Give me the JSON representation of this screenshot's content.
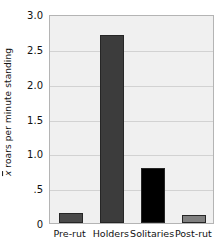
{
  "chart_data": {
    "type": "bar",
    "title": "",
    "xlabel": "",
    "ylabel": "x̄ roars per minute standing",
    "ylabel_prefix": "x",
    "ylabel_rest": " roars per minute standing",
    "categories": [
      "Pre-rut",
      "Holders",
      "Solitaries",
      "Post-rut"
    ],
    "values": [
      0.14,
      2.7,
      0.79,
      0.12
    ],
    "bar_colors": [
      "#4a4a4a",
      "#3c3c3c",
      "#000000",
      "#808080"
    ],
    "ylim": [
      0,
      3.0
    ],
    "yticks": [
      0,
      0.5,
      1.0,
      1.5,
      2.0,
      2.5,
      3.0
    ],
    "ytick_labels": [
      "0",
      ".5",
      "1.0",
      "1.5",
      "2.0",
      "2.5",
      "3.0"
    ],
    "grid": true,
    "grid_axis": "y",
    "legend": null,
    "legend_position": "none",
    "plot_background": "#f0f0f0",
    "grid_color": "#d2d2d2",
    "axis_border_color": "#b4b4b4",
    "text_color": "#111111"
  }
}
